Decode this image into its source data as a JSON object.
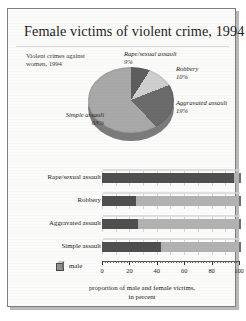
{
  "figure": {
    "title": "Female victims of violent crime, 1994"
  },
  "pie": {
    "subtitle": "Violent crimes against women, 1994",
    "labels": [
      {
        "name": "Rape/sexual assault",
        "pct": "9%"
      },
      {
        "name": "Robbery",
        "pct": "10%"
      },
      {
        "name": "Aggravated assault",
        "pct": "19%"
      },
      {
        "name": "Simple assault",
        "pct": "63%"
      }
    ]
  },
  "bars": {
    "legend_label": "male",
    "legend_icon": "cube-icon",
    "x_caption": "proportion of male and female victims,\nin percent",
    "x_ticks": [
      "0",
      "20",
      "40",
      "60",
      "80",
      "100"
    ]
  },
  "chart_data": [
    {
      "type": "pie",
      "title": "Violent crimes against women, 1994",
      "labels": [
        "Rape/sexual assault",
        "Robbery",
        "Aggravated assault",
        "Simple assault"
      ],
      "values": [
        9,
        10,
        19,
        63
      ],
      "unit": "percent",
      "colors": [
        "#5d5d5d",
        "#cfcfcf",
        "#6b6b6b",
        "#a9a9a9"
      ],
      "three_d": true,
      "legend": "none (direct labels)"
    },
    {
      "type": "bar",
      "orientation": "horizontal",
      "stacked": true,
      "title": "",
      "xlabel": "proportion of male and female victims, in percent",
      "ylabel": "",
      "xlim": [
        0,
        100
      ],
      "xticks": [
        0,
        20,
        40,
        60,
        80,
        100
      ],
      "grid": true,
      "categories": [
        "Rape/sexual assault",
        "Robbery",
        "Aggravated assault",
        "Simple assault"
      ],
      "series": [
        {
          "name": "female",
          "values": [
            96,
            25,
            26,
            43
          ],
          "color": "#4f4f4f"
        },
        {
          "name": "male",
          "values": [
            4,
            75,
            74,
            57
          ],
          "color": "#b2b2b2"
        }
      ],
      "legend": [
        "male"
      ],
      "legend_position": "bottom-left"
    }
  ]
}
